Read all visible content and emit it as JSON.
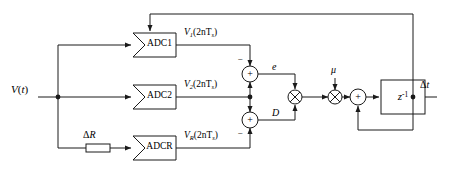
{
  "diagram": {
    "stroke_color": "#1a1a1a",
    "fill_color": "#ffffff",
    "background": "#ffffff"
  },
  "input": {
    "signal_label_v": "V",
    "signal_label_paren_open": "(",
    "signal_label_t": "t",
    "signal_label_paren_close": ")",
    "full": "V(t)"
  },
  "blocks": [
    {
      "id": "adc1",
      "label": "ADC1",
      "shape": "pentagon-arrow"
    },
    {
      "id": "adc2",
      "label": "ADC2",
      "shape": "pentagon-arrow"
    },
    {
      "id": "adcr",
      "label": "ADCR",
      "shape": "pentagon-arrow"
    },
    {
      "id": "delta_r",
      "label": "",
      "shape": "rect"
    },
    {
      "id": "delay",
      "label": "z",
      "exponent": "-1",
      "shape": "rect"
    }
  ],
  "signals": {
    "v1": {
      "base": "V",
      "sub": "1",
      "arg": "(2nT",
      "arg_sub": "s",
      "arg_close": ")",
      "full": "V1(2nTs)"
    },
    "v2": {
      "base": "V",
      "sub": "2",
      "arg": "(2nT",
      "arg_sub": "s",
      "arg_close": ")",
      "full": "V2(2nTs)"
    },
    "vr": {
      "base": "V",
      "sub": "R",
      "arg": "(2nT",
      "arg_sub": "s",
      "arg_close": ")",
      "full": "VR(2nTs)"
    },
    "error": "e",
    "direction": "D",
    "step_size": "μ",
    "output_delta": "Δ",
    "output_t": "t",
    "output_full": "Δt",
    "delta_r_label_delta": "Δ",
    "delta_r_label_r": "R",
    "delta_r_full": "ΔR"
  },
  "operators": {
    "sum_top": "+",
    "sum_top_negative": "−",
    "sum_bottom": "+",
    "sum_bottom_negative": "−",
    "mult_ed": "×",
    "mult_mu": "×",
    "accumulator_sum": "+"
  },
  "delay_block": {
    "z": "z",
    "exponent": "-1"
  }
}
